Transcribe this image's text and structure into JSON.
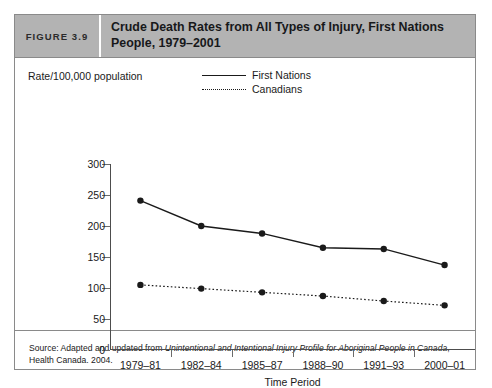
{
  "figure": {
    "number_label": "FIGURE 3.9",
    "title": "Crude Death Rates from All Types of Injury, First Nations People, 1979–2001"
  },
  "legend": {
    "position": "top-center",
    "entries": [
      {
        "label": "First Nations",
        "style": "solid"
      },
      {
        "label": "Canadians",
        "style": "dotted"
      }
    ]
  },
  "source": {
    "prefix": "Source: Adapted and updated from ",
    "italic_title": "Unintentional and Intentional Injury Profile for Aboriginal People in Canada",
    "suffix": ", Health Canada. 2004."
  },
  "chart_data": {
    "type": "line",
    "title": "Crude Death Rates from All Types of Injury, First Nations People, 1979–2001",
    "xlabel": "Time Period",
    "ylabel": "Rate/100,000 population",
    "categories": [
      "1979–81",
      "1982–84",
      "1985–87",
      "1988–90",
      "1991–93",
      "2000–01"
    ],
    "ylim": [
      0,
      300
    ],
    "yticks": [
      0,
      50,
      100,
      150,
      200,
      250,
      300
    ],
    "grid": false,
    "legend_position": "top-center",
    "series": [
      {
        "name": "First Nations",
        "style": "solid",
        "marker": "filled-circle",
        "values": [
          241,
          200,
          188,
          165,
          163,
          137
        ]
      },
      {
        "name": "Canadians",
        "style": "dotted",
        "marker": "filled-circle",
        "values": [
          105,
          99,
          93,
          87,
          79,
          72
        ]
      }
    ]
  },
  "colors": {
    "header_bg": "#b3b3b3",
    "border": "#8a8a8a",
    "ink": "#1a1a1a"
  }
}
